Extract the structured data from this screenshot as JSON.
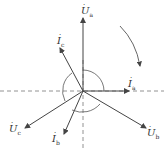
{
  "diagram": {
    "type": "phasor-diagram",
    "labels": {
      "Ua": {
        "main": "U",
        "sub": "a"
      },
      "Ub": {
        "main": "U",
        "sub": "b"
      },
      "Uc": {
        "main": "U",
        "sub": "c"
      },
      "Ia": {
        "main": "I",
        "sub": "a"
      },
      "Ib": {
        "main": "I",
        "sub": "b"
      },
      "Ic": {
        "main": "I",
        "sub": "c"
      }
    },
    "dot": "·",
    "line_color": "#444444"
  }
}
